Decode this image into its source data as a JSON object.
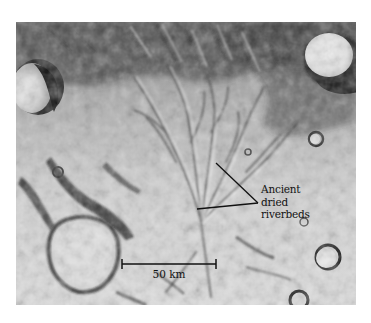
{
  "image": {
    "description": "Grayscale orbital photograph of cratered Martian terrain showing branching channel network",
    "background_color": "#ffffff",
    "photo_tone_light": "#e6e6e6",
    "photo_tone_dark": "#1a1a1a"
  },
  "annotation": {
    "lines": [
      "Ancient",
      "dried",
      "riverbeds"
    ],
    "leader_color": "#111111"
  },
  "scale_bar": {
    "label": "50 km",
    "color": "#111111"
  }
}
